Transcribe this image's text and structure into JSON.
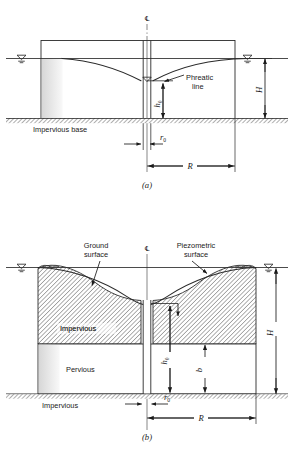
{
  "figure": {
    "type": "engineering-diagram",
    "background": "#ffffff",
    "ink": "#1a1a1a"
  },
  "panel_a": {
    "caption": "(a)",
    "centerline_symbol": "℄",
    "labels": {
      "phreatic_line": "Phreatic\nline",
      "phreatic_line_l1": "Phreatic",
      "phreatic_line_l2": "line",
      "impervious_base": "Impervious base"
    },
    "dimensions": {
      "H": "H",
      "h0_base": "h",
      "h0_sub": "0",
      "r0_base": "r",
      "r0_sub": "0",
      "R": "R"
    },
    "symbols": {
      "water_table_left": "water-table-triangle",
      "water_table_right": "water-table-triangle",
      "water_table_well": "water-table-triangle"
    }
  },
  "panel_b": {
    "caption": "(b)",
    "centerline_symbol": "℄",
    "labels": {
      "ground_surface_l1": "Ground",
      "ground_surface_l2": "surface",
      "piezometric_surface_l1": "Piezometric",
      "piezometric_surface_l2": "surface",
      "impervious_layer": "Impervious",
      "pervious_layer": "Pervious",
      "impervious_base": "Impervious"
    },
    "dimensions": {
      "H": "H",
      "h0_base": "h",
      "h0_sub": "0",
      "b": "b",
      "r0_base": "r",
      "r0_sub": "0",
      "R": "R"
    },
    "symbols": {
      "water_table_left": "water-table-triangle",
      "water_table_right": "water-table-triangle"
    }
  }
}
